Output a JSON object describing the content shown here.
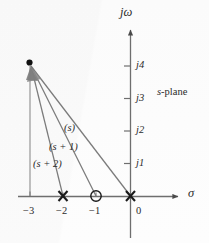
{
  "figure": {
    "plane_label": "s-plane",
    "background_color": "#fdfdfd",
    "axis_color": "#6e6e6e",
    "vector_color": "#7a7a7a",
    "marker_color": "#1a1a1a",
    "text_color": "#2b2b2b"
  },
  "axes": {
    "vertical": {
      "name": "jω",
      "name_parts": {
        "j": "j",
        "omega": "ω"
      },
      "ticks": [
        {
          "label": "j1",
          "value": 1
        },
        {
          "label": "j2",
          "value": 2
        },
        {
          "label": "j3",
          "value": 3
        },
        {
          "label": "j4",
          "value": 4
        }
      ]
    },
    "horizontal": {
      "name": "σ",
      "ticks": [
        {
          "label": "−3",
          "value": -3
        },
        {
          "label": "−2",
          "value": -2
        },
        {
          "label": "−1",
          "value": -1
        },
        {
          "label": "0",
          "value": 0
        }
      ]
    }
  },
  "markers": [
    {
      "kind": "pole",
      "glyph": "X",
      "sigma": -2,
      "omega": 0
    },
    {
      "kind": "zero",
      "glyph": "O",
      "sigma": -1,
      "omega": 0
    },
    {
      "kind": "pole",
      "glyph": "X",
      "sigma": 0,
      "omega": 0
    }
  ],
  "test_point": {
    "sigma": -3,
    "omega": 4,
    "glyph": "dot"
  },
  "vectors": [
    {
      "label": "(s)",
      "from_sigma": 0,
      "from_omega": 0,
      "to_sigma": -3,
      "to_omega": 4,
      "label_x": 64,
      "label_y": 123
    },
    {
      "label": "(s + 1)",
      "from_sigma": -1,
      "from_omega": 0,
      "to_sigma": -3,
      "to_omega": 4,
      "label_x": 49,
      "label_y": 142
    },
    {
      "label": "(s + 2)",
      "from_sigma": -2,
      "from_omega": 0,
      "to_sigma": -3,
      "to_omega": 4,
      "label_x": 33,
      "label_y": 159
    }
  ],
  "chart_data": {
    "type": "scatter",
    "title": "s-plane",
    "xlabel": "σ",
    "ylabel": "jω",
    "xlim": [
      -3.7,
      1.8
    ],
    "ylim": [
      -1.3,
      5.2
    ],
    "grid": false,
    "legend": "none",
    "xticks": [
      -3,
      -2,
      -1,
      0
    ],
    "xticklabels": [
      "−3",
      "−2",
      "−1",
      "0"
    ],
    "yticks": [
      1,
      2,
      3,
      4
    ],
    "yticklabels": [
      "j1",
      "j2",
      "j3",
      "j4"
    ],
    "series": [
      {
        "name": "poles",
        "marker": "x",
        "x": [
          -2,
          0
        ],
        "y": [
          0,
          0
        ]
      },
      {
        "name": "zeros",
        "marker": "o",
        "x": [
          -1
        ],
        "y": [
          0
        ]
      },
      {
        "name": "test point",
        "marker": ".",
        "x": [
          -3
        ],
        "y": [
          4
        ]
      }
    ],
    "annotations": [
      {
        "text": "(s)",
        "x": -2.0,
        "y": 2.25
      },
      {
        "text": "(s + 1)",
        "x": -2.45,
        "y": 1.65
      },
      {
        "text": "(s + 2)",
        "x": -2.95,
        "y": 1.15
      },
      {
        "text": "s-plane",
        "x": 0.75,
        "y": 3.0
      }
    ]
  }
}
